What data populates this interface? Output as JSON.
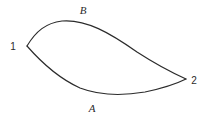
{
  "figure": {
    "type": "path-diagram",
    "background_color": "#ffffff",
    "stroke_color": "#2b2b2b",
    "width": 210,
    "height": 117
  },
  "nodes": [
    {
      "id": "node-1",
      "label": "1",
      "x": 27,
      "y": 46,
      "label_x": 13,
      "label_y": 50
    },
    {
      "id": "node-2",
      "label": "2",
      "x": 186,
      "y": 79,
      "label_x": 194,
      "label_y": 84
    }
  ],
  "paths": [
    {
      "id": "path-B",
      "label": "B",
      "position": "upper",
      "label_x": 83,
      "label_y": 14,
      "d": "M 27 46 C 36 31 46 23 62 21 C 86 19 110 33 137 52 C 157 65 175 74 186 79"
    },
    {
      "id": "path-A",
      "label": "A",
      "position": "lower",
      "label_x": 92,
      "label_y": 112,
      "d": "M 27 46 C 41 62 58 78 80 88 C 101 96 122 96 145 92 C 164 88 178 83 186 79"
    }
  ]
}
